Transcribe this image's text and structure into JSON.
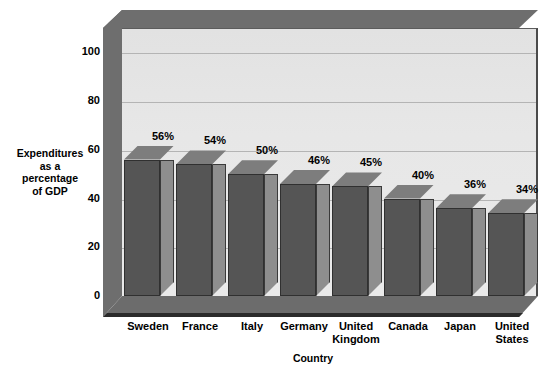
{
  "chart_data": {
    "type": "bar",
    "title": "",
    "xlabel": "Country",
    "ylabel": "Expenditures\nas a\npercentage\nof GDP",
    "categories": [
      "Sweden",
      "France",
      "Italy",
      "Germany",
      "United\nKingdom",
      "Canada",
      "Japan",
      "United\nStates"
    ],
    "values": [
      56,
      54,
      50,
      46,
      45,
      40,
      36,
      34
    ],
    "data_labels": [
      "56%",
      "54%",
      "50%",
      "46%",
      "45%",
      "40%",
      "36%",
      "34%"
    ],
    "ylim": [
      0,
      110
    ],
    "y_ticks": [
      0,
      20,
      40,
      60,
      80,
      100
    ],
    "y_tick_labels": [
      "0",
      "20",
      "40",
      "60",
      "80",
      "100"
    ],
    "grid": true,
    "legend": "none",
    "style": "3d-column",
    "colors": {
      "bar_front": "#555555",
      "bar_side": "#8e8e8e",
      "bar_top": "#7d7d7d",
      "panel": "#e7e7e7",
      "box_wall": "#6e6e6e",
      "gridline": "#b4b4b4",
      "text": "#000000",
      "background": "#ffffff"
    }
  },
  "axes": {
    "y_title": "Expenditures\nas a\npercentage\nof GDP",
    "x_title": "Country",
    "y_tick_labels": [
      "100",
      "80",
      "60",
      "40",
      "20",
      "0"
    ]
  }
}
